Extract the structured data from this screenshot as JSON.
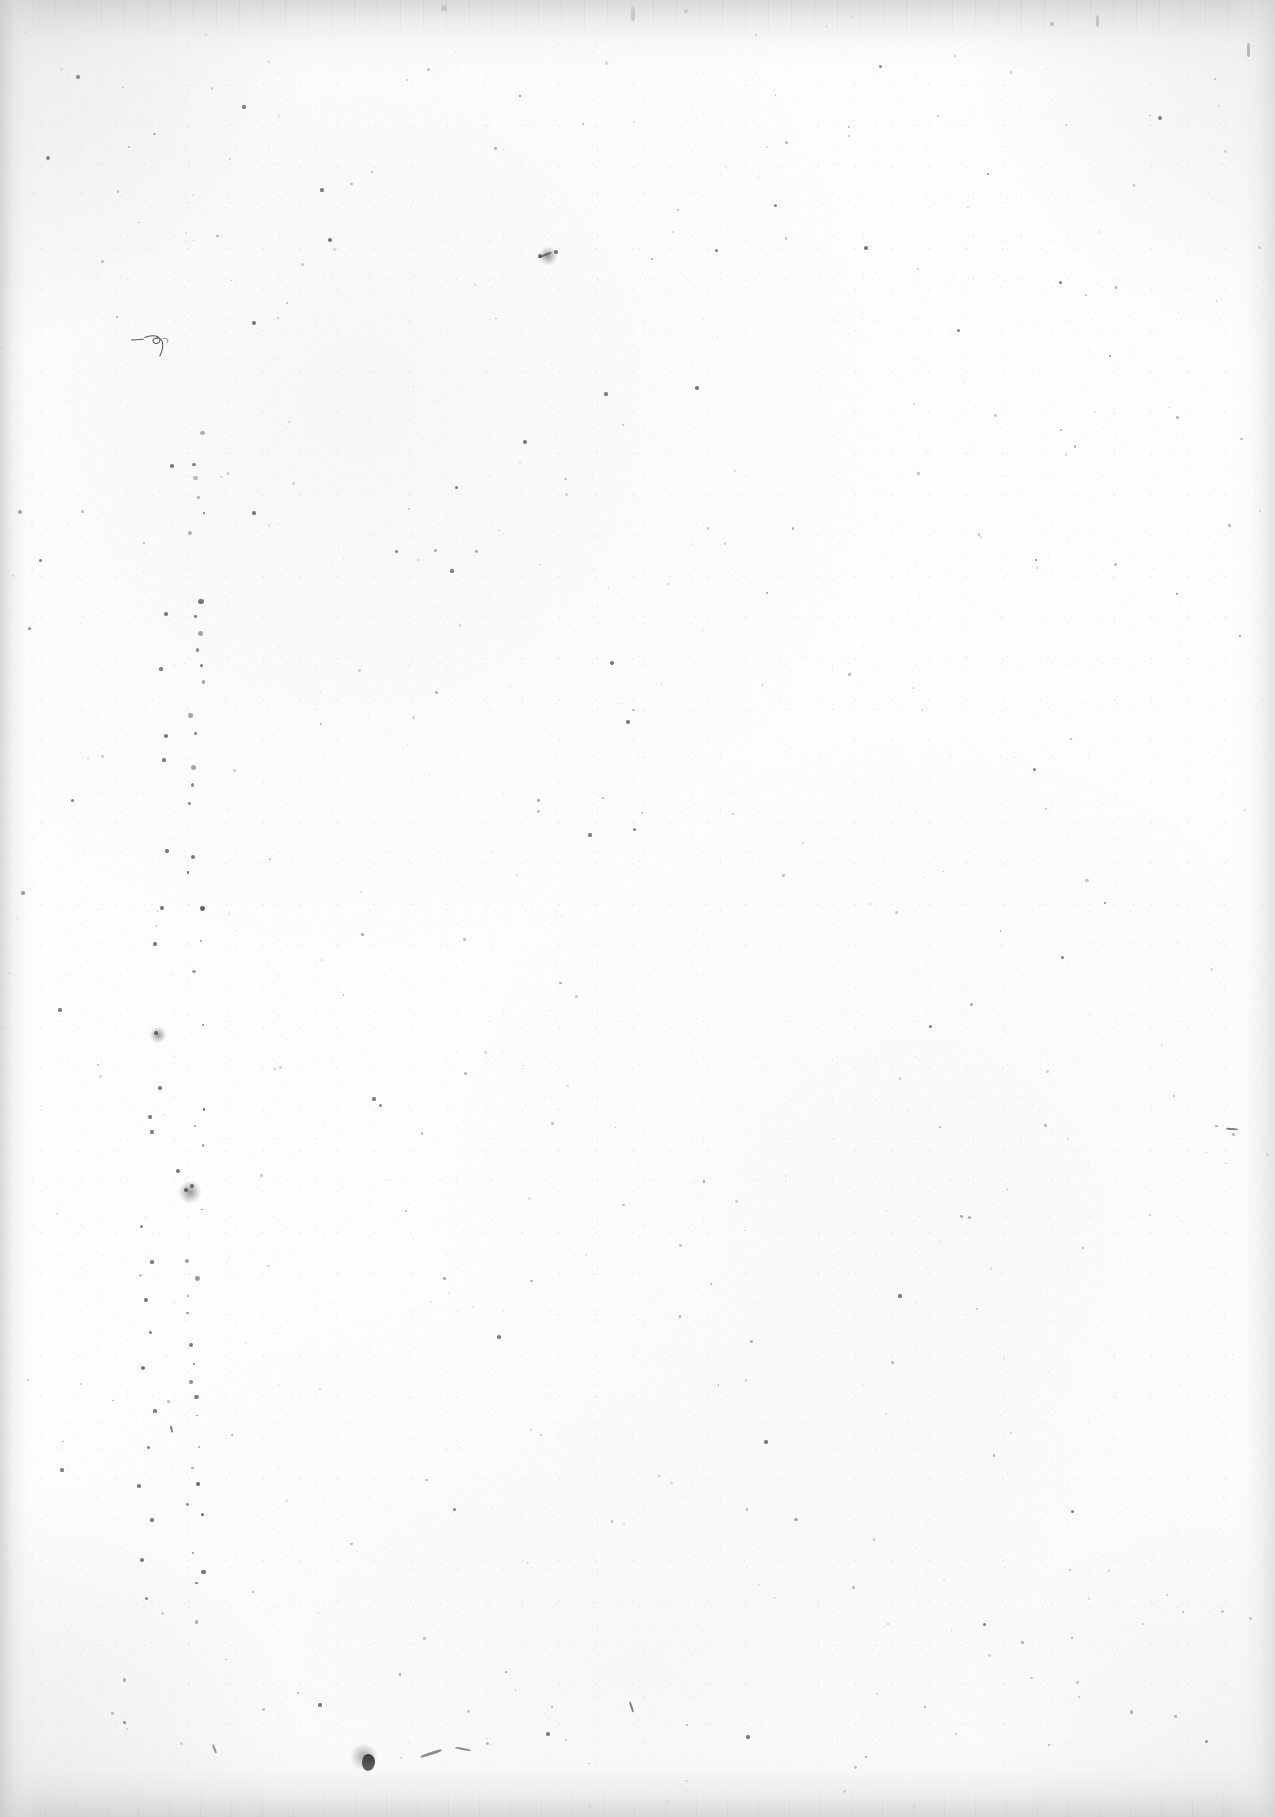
{
  "page": {
    "kind": "scanned-document-page",
    "content_state": "blank",
    "visible_text": "",
    "width_px": 1275,
    "height_px": 1817,
    "orientation": "portrait",
    "paper_color": "#fdfdfd",
    "ink_color": "#1a1a1a",
    "edge_shadow_color": "#d4d4d4"
  },
  "edges": {
    "top": {
      "name": "top-scanner-band",
      "height_px": 72,
      "tone": "#d6d6d6",
      "has_streaks": true
    },
    "bottom": {
      "name": "bottom-scanner-band",
      "height_px": 78,
      "tone": "#d4d4d4",
      "has_streaks": true
    },
    "left": {
      "name": "left-edge-gradient",
      "width_px": 40,
      "tone": "#cecece",
      "has_streaks": false
    },
    "right": {
      "name": "right-edge-gradient",
      "width_px": 46,
      "tone": "#d6d6d6",
      "has_streaks": false
    }
  },
  "artifacts": {
    "summary": "Scattered dust specks, short fibers, a faint pencil squiggle and one prominent ink blob.",
    "dust_line": {
      "name": "vertical-dust-line",
      "x_px": 196,
      "y_start_px": 430,
      "y_end_px": 1640,
      "note": "Near-vertical chain of specks left of center, a scanner/film defect."
    },
    "squiggle": {
      "name": "pencil-squiggle",
      "x_px": 128,
      "y_px": 330,
      "width_px": 62,
      "height_px": 30
    },
    "blob": {
      "name": "ink-blob",
      "x_px": 362,
      "y_px": 1754,
      "width_px": 13,
      "height_px": 17
    },
    "specks": [
      {
        "x": 444,
        "y": 8,
        "r": 2.6
      },
      {
        "x": 686,
        "y": 11,
        "r": 2.0
      },
      {
        "x": 1052,
        "y": 24,
        "r": 2.2
      },
      {
        "x": 78,
        "y": 77,
        "r": 1.8
      },
      {
        "x": 244,
        "y": 107,
        "r": 1.6
      },
      {
        "x": 520,
        "y": 96,
        "r": 1.4
      },
      {
        "x": 880,
        "y": 66,
        "r": 1.5
      },
      {
        "x": 1160,
        "y": 118,
        "r": 1.7
      },
      {
        "x": 48,
        "y": 158,
        "r": 1.9
      },
      {
        "x": 322,
        "y": 190,
        "r": 1.6
      },
      {
        "x": 775,
        "y": 205,
        "r": 1.5
      },
      {
        "x": 988,
        "y": 174,
        "r": 1.4
      },
      {
        "x": 330,
        "y": 240,
        "r": 1.7
      },
      {
        "x": 540,
        "y": 256,
        "r": 2.1
      },
      {
        "x": 556,
        "y": 252,
        "r": 1.8
      },
      {
        "x": 716,
        "y": 250,
        "r": 1.5
      },
      {
        "x": 866,
        "y": 248,
        "r": 1.6
      },
      {
        "x": 1060,
        "y": 282,
        "r": 1.5
      },
      {
        "x": 254,
        "y": 323,
        "r": 1.9
      },
      {
        "x": 606,
        "y": 394,
        "r": 1.6
      },
      {
        "x": 697,
        "y": 388,
        "r": 1.8
      },
      {
        "x": 958,
        "y": 330,
        "r": 1.5
      },
      {
        "x": 1110,
        "y": 356,
        "r": 1.4
      },
      {
        "x": 172,
        "y": 466,
        "r": 1.8
      },
      {
        "x": 456,
        "y": 487,
        "r": 1.5
      },
      {
        "x": 20,
        "y": 512,
        "r": 1.7
      },
      {
        "x": 254,
        "y": 513,
        "r": 1.6
      },
      {
        "x": 525,
        "y": 442,
        "r": 1.9
      },
      {
        "x": 40,
        "y": 560,
        "r": 1.5
      },
      {
        "x": 396,
        "y": 551,
        "r": 1.5
      },
      {
        "x": 452,
        "y": 571,
        "r": 1.6
      },
      {
        "x": 1036,
        "y": 560,
        "r": 1.4
      },
      {
        "x": 166,
        "y": 614,
        "r": 1.7
      },
      {
        "x": 612,
        "y": 663,
        "r": 2.0
      },
      {
        "x": 29,
        "y": 628,
        "r": 1.5
      },
      {
        "x": 1240,
        "y": 636,
        "r": 1.4
      },
      {
        "x": 161,
        "y": 669,
        "r": 1.6
      },
      {
        "x": 628,
        "y": 722,
        "r": 2.0
      },
      {
        "x": 166,
        "y": 736,
        "r": 1.7
      },
      {
        "x": 164,
        "y": 760,
        "r": 1.6
      },
      {
        "x": 1034,
        "y": 769,
        "r": 1.5
      },
      {
        "x": 72,
        "y": 800,
        "r": 1.5
      },
      {
        "x": 590,
        "y": 835,
        "r": 1.6
      },
      {
        "x": 634,
        "y": 829,
        "r": 1.5
      },
      {
        "x": 167,
        "y": 851,
        "r": 1.8
      },
      {
        "x": 23,
        "y": 893,
        "r": 1.6
      },
      {
        "x": 162,
        "y": 908,
        "r": 1.9
      },
      {
        "x": 1105,
        "y": 903,
        "r": 1.4
      },
      {
        "x": 155,
        "y": 944,
        "r": 1.6
      },
      {
        "x": 1062,
        "y": 957,
        "r": 1.5
      },
      {
        "x": 60,
        "y": 1010,
        "r": 1.6
      },
      {
        "x": 156,
        "y": 1033,
        "r": 2.3
      },
      {
        "x": 930,
        "y": 1026,
        "r": 1.5
      },
      {
        "x": 160,
        "y": 1088,
        "r": 1.7
      },
      {
        "x": 374,
        "y": 1099,
        "r": 1.6
      },
      {
        "x": 380,
        "y": 1105,
        "r": 1.5
      },
      {
        "x": 150,
        "y": 1117,
        "r": 1.8
      },
      {
        "x": 152,
        "y": 1132,
        "r": 1.6
      },
      {
        "x": 178,
        "y": 1171,
        "r": 1.7
      },
      {
        "x": 186,
        "y": 1190,
        "r": 2.4
      },
      {
        "x": 192,
        "y": 1186,
        "r": 1.8
      },
      {
        "x": 141,
        "y": 1226,
        "r": 1.5
      },
      {
        "x": 152,
        "y": 1262,
        "r": 1.6
      },
      {
        "x": 146,
        "y": 1300,
        "r": 1.7
      },
      {
        "x": 900,
        "y": 1296,
        "r": 1.6
      },
      {
        "x": 150,
        "y": 1332,
        "r": 1.5
      },
      {
        "x": 143,
        "y": 1368,
        "r": 1.9
      },
      {
        "x": 499,
        "y": 1337,
        "r": 1.7
      },
      {
        "x": 155,
        "y": 1411,
        "r": 1.6
      },
      {
        "x": 148,
        "y": 1447,
        "r": 1.5
      },
      {
        "x": 139,
        "y": 1486,
        "r": 1.8
      },
      {
        "x": 152,
        "y": 1520,
        "r": 1.6
      },
      {
        "x": 142,
        "y": 1560,
        "r": 1.7
      },
      {
        "x": 146,
        "y": 1598,
        "r": 1.5
      },
      {
        "x": 766,
        "y": 1442,
        "r": 1.8
      },
      {
        "x": 1072,
        "y": 1511,
        "r": 1.5
      },
      {
        "x": 454,
        "y": 1509,
        "r": 1.5
      },
      {
        "x": 62,
        "y": 1470,
        "r": 1.6
      },
      {
        "x": 984,
        "y": 1624,
        "r": 1.5
      },
      {
        "x": 320,
        "y": 1705,
        "r": 1.6
      },
      {
        "x": 124,
        "y": 1722,
        "r": 1.5
      },
      {
        "x": 548,
        "y": 1734,
        "r": 1.7
      },
      {
        "x": 748,
        "y": 1737,
        "r": 1.6
      },
      {
        "x": 1206,
        "y": 1741,
        "r": 1.5
      },
      {
        "x": 866,
        "y": 1757,
        "r": 1.4
      }
    ],
    "fibers": [
      {
        "x": 420,
        "y": 1752,
        "w": 22,
        "h": 3,
        "rot": -18
      },
      {
        "x": 455,
        "y": 1748,
        "w": 16,
        "h": 2,
        "rot": 12
      },
      {
        "x": 210,
        "y": 1748,
        "w": 9,
        "h": 2,
        "rot": 68
      },
      {
        "x": 626,
        "y": 1706,
        "w": 11,
        "h": 2,
        "rot": 72
      },
      {
        "x": 168,
        "y": 1428,
        "w": 7,
        "h": 2,
        "rot": 78
      },
      {
        "x": 1226,
        "y": 1128,
        "w": 12,
        "h": 2,
        "rot": 4
      },
      {
        "x": 538,
        "y": 254,
        "w": 14,
        "h": 2,
        "rot": -22
      },
      {
        "x": 1247,
        "y": 43,
        "w": 3,
        "h": 14,
        "rot": 0
      },
      {
        "x": 1096,
        "y": 15,
        "w": 3,
        "h": 12,
        "rot": 0
      },
      {
        "x": 631,
        "y": 6,
        "w": 4,
        "h": 15,
        "rot": 0
      }
    ],
    "smudges": [
      {
        "x": 190,
        "y": 1192,
        "r": 11
      },
      {
        "x": 158,
        "y": 1035,
        "r": 8
      },
      {
        "x": 548,
        "y": 256,
        "r": 9
      },
      {
        "x": 364,
        "y": 1757,
        "r": 13
      }
    ]
  }
}
